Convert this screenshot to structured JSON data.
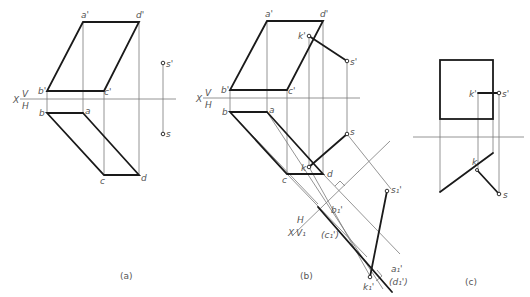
{
  "figures": [
    {
      "id": "a",
      "caption": "(a)",
      "axis_labels": {
        "x": "X",
        "v": "V",
        "h": "H"
      },
      "points": {
        "a_prime": "a'",
        "d_prime": "d'",
        "b_prime": "b'",
        "c_prime": "c'",
        "a": "a",
        "b": "b",
        "c": "c",
        "d": "d",
        "s_prime": "s'",
        "s": "s"
      }
    },
    {
      "id": "b",
      "caption": "(b)",
      "axis_labels": {
        "x": "X",
        "v": "V",
        "h": "H",
        "x1": "X",
        "h1": "H",
        "v1": "V₁"
      },
      "points": {
        "a_prime": "a'",
        "d_prime": "d'",
        "b_prime": "b'",
        "c_prime": "c'",
        "a": "a",
        "b": "b",
        "c": "c",
        "d": "d",
        "k_prime": "k'",
        "s_prime": "s'",
        "s": "s",
        "k": "k",
        "b1_prime": "b₁'",
        "c1_prime": "(c₁')",
        "k1_prime": "k₁'",
        "a1_prime": "a₁'",
        "d1_prime": "(d₁')",
        "s1_prime": "s₁'"
      }
    },
    {
      "id": "c",
      "caption": "(c)",
      "points": {
        "k_prime": "k'",
        "s_prime": "s'",
        "k": "k",
        "s": "s"
      }
    }
  ]
}
